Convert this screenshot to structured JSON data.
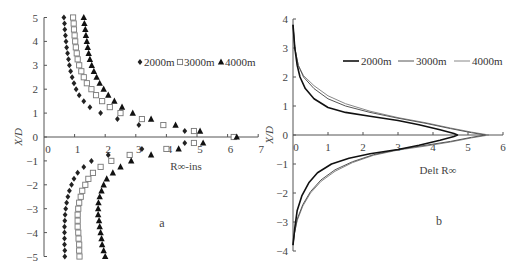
{
  "chart_data": [
    {
      "panel": "a",
      "type": "scatter",
      "title": "",
      "panel_label": "a",
      "xlabel": "R∞-ins",
      "ylabel": "X/D",
      "xlim": [
        0,
        7
      ],
      "ylim": [
        -5,
        5
      ],
      "xticks": [
        "0",
        "1",
        "2",
        "3",
        "4",
        "5",
        "6",
        "7"
      ],
      "yticks": [
        "5",
        "4",
        "3",
        "2",
        "1",
        "0",
        "−1",
        "−2",
        "−3",
        "−4",
        "−5"
      ],
      "grid": false,
      "legend_position": "upper right",
      "series": [
        {
          "name": "2000m",
          "marker": "diamond",
          "points": [
            [
              0.65,
              5
            ],
            [
              0.67,
              4.75
            ],
            [
              0.68,
              4.5
            ],
            [
              0.7,
              4.25
            ],
            [
              0.72,
              4
            ],
            [
              0.74,
              3.75
            ],
            [
              0.77,
              3.5
            ],
            [
              0.8,
              3.25
            ],
            [
              0.83,
              3
            ],
            [
              0.87,
              2.75
            ],
            [
              0.92,
              2.5
            ],
            [
              0.98,
              2.25
            ],
            [
              1.05,
              2
            ],
            [
              1.15,
              1.75
            ],
            [
              1.3,
              1.5
            ],
            [
              1.5,
              1.25
            ],
            [
              1.85,
              1
            ],
            [
              2.4,
              0.75
            ],
            [
              3.1,
              0.5
            ],
            [
              4.6,
              0.25
            ],
            [
              6.2,
              0
            ],
            [
              4.6,
              -0.25
            ],
            [
              3.2,
              -0.5
            ],
            [
              2.1,
              -0.75
            ],
            [
              1.55,
              -1
            ],
            [
              1.3,
              -1.25
            ],
            [
              1.1,
              -1.5
            ],
            [
              0.98,
              -1.75
            ],
            [
              0.9,
              -2
            ],
            [
              0.83,
              -2.25
            ],
            [
              0.78,
              -2.5
            ],
            [
              0.74,
              -2.75
            ],
            [
              0.71,
              -3
            ],
            [
              0.69,
              -3.25
            ],
            [
              0.68,
              -3.5
            ],
            [
              0.67,
              -3.75
            ],
            [
              0.67,
              -4
            ],
            [
              0.67,
              -4.25
            ],
            [
              0.67,
              -4.5
            ],
            [
              0.68,
              -4.75
            ],
            [
              0.68,
              -5
            ]
          ]
        },
        {
          "name": "3000m",
          "marker": "open-square",
          "points": [
            [
              0.95,
              5
            ],
            [
              0.97,
              4.75
            ],
            [
              0.98,
              4.5
            ],
            [
              1.0,
              4.25
            ],
            [
              1.02,
              4
            ],
            [
              1.04,
              3.75
            ],
            [
              1.07,
              3.5
            ],
            [
              1.1,
              3.25
            ],
            [
              1.15,
              3
            ],
            [
              1.22,
              2.75
            ],
            [
              1.3,
              2.5
            ],
            [
              1.4,
              2.25
            ],
            [
              1.55,
              2
            ],
            [
              1.7,
              1.75
            ],
            [
              1.9,
              1.5
            ],
            [
              2.15,
              1.25
            ],
            [
              2.5,
              1
            ],
            [
              3.2,
              0.75
            ],
            [
              3.9,
              0.5
            ],
            [
              4.9,
              0.25
            ],
            [
              6.2,
              0
            ],
            [
              4.9,
              -0.25
            ],
            [
              4.0,
              -0.5
            ],
            [
              2.8,
              -0.75
            ],
            [
              2.2,
              -1
            ],
            [
              1.85,
              -1.25
            ],
            [
              1.6,
              -1.5
            ],
            [
              1.45,
              -1.75
            ],
            [
              1.35,
              -2
            ],
            [
              1.25,
              -2.25
            ],
            [
              1.2,
              -2.5
            ],
            [
              1.15,
              -2.75
            ],
            [
              1.12,
              -3
            ],
            [
              1.1,
              -3.25
            ],
            [
              1.1,
              -3.5
            ],
            [
              1.1,
              -3.75
            ],
            [
              1.12,
              -4
            ],
            [
              1.13,
              -4.25
            ],
            [
              1.15,
              -4.5
            ],
            [
              1.15,
              -4.75
            ],
            [
              1.16,
              -5
            ]
          ]
        },
        {
          "name": "4000m",
          "marker": "filled-triangle",
          "points": [
            [
              1.3,
              5
            ],
            [
              1.32,
              4.75
            ],
            [
              1.35,
              4.5
            ],
            [
              1.37,
              4.25
            ],
            [
              1.4,
              4
            ],
            [
              1.43,
              3.75
            ],
            [
              1.46,
              3.5
            ],
            [
              1.5,
              3.25
            ],
            [
              1.56,
              3
            ],
            [
              1.63,
              2.75
            ],
            [
              1.72,
              2.5
            ],
            [
              1.82,
              2.25
            ],
            [
              1.95,
              2
            ],
            [
              2.1,
              1.75
            ],
            [
              2.3,
              1.5
            ],
            [
              2.55,
              1.25
            ],
            [
              2.9,
              1
            ],
            [
              3.5,
              0.75
            ],
            [
              4.3,
              0.5
            ],
            [
              5.1,
              0.25
            ],
            [
              6.3,
              0
            ],
            [
              5.2,
              -0.25
            ],
            [
              4.4,
              -0.5
            ],
            [
              3.5,
              -0.75
            ],
            [
              2.85,
              -1
            ],
            [
              2.5,
              -1.25
            ],
            [
              2.25,
              -1.5
            ],
            [
              2.05,
              -1.75
            ],
            [
              1.95,
              -2
            ],
            [
              1.88,
              -2.25
            ],
            [
              1.82,
              -2.5
            ],
            [
              1.78,
              -2.75
            ],
            [
              1.77,
              -3
            ],
            [
              1.77,
              -3.25
            ],
            [
              1.8,
              -3.5
            ],
            [
              1.82,
              -3.75
            ],
            [
              1.85,
              -4
            ],
            [
              1.88,
              -4.25
            ],
            [
              1.9,
              -4.5
            ],
            [
              1.95,
              -4.75
            ],
            [
              2.0,
              -5
            ]
          ]
        }
      ]
    },
    {
      "panel": "b",
      "type": "line",
      "title": "",
      "panel_label": "b",
      "xlabel": "Delt R∞",
      "ylabel": "X/D",
      "xlim": [
        0,
        6
      ],
      "ylim": [
        -4,
        4
      ],
      "xticks": [
        "0",
        "1",
        "2",
        "3",
        "4",
        "5",
        "6"
      ],
      "yticks": [
        "4",
        "3",
        "2",
        "1",
        "0",
        "−1",
        "−2",
        "−3",
        "−4"
      ],
      "grid": false,
      "legend_position": "upper right",
      "series": [
        {
          "name": "2000m",
          "color": "#111111",
          "width": 1.6,
          "points": [
            [
              0,
              3.8
            ],
            [
              0.05,
              3.0
            ],
            [
              0.12,
              2.4
            ],
            [
              0.2,
              2.0
            ],
            [
              0.35,
              1.6
            ],
            [
              0.6,
              1.25
            ],
            [
              1.0,
              0.95
            ],
            [
              1.5,
              0.78
            ],
            [
              2.2,
              0.65
            ],
            [
              3.0,
              0.5
            ],
            [
              3.6,
              0.35
            ],
            [
              4.2,
              0.18
            ],
            [
              4.6,
              0.05
            ],
            [
              4.7,
              0
            ],
            [
              4.6,
              -0.05
            ],
            [
              4.2,
              -0.18
            ],
            [
              3.6,
              -0.35
            ],
            [
              3.0,
              -0.5
            ],
            [
              2.2,
              -0.65
            ],
            [
              1.6,
              -0.8
            ],
            [
              1.1,
              -1.0
            ],
            [
              0.7,
              -1.3
            ],
            [
              0.45,
              -1.65
            ],
            [
              0.25,
              -2.1
            ],
            [
              0.12,
              -2.6
            ],
            [
              0.05,
              -3.2
            ],
            [
              0,
              -3.8
            ]
          ]
        },
        {
          "name": "3000m",
          "color": "#555555",
          "width": 1,
          "points": [
            [
              0,
              3.8
            ],
            [
              0.05,
              3.0
            ],
            [
              0.15,
              2.4
            ],
            [
              0.3,
              2.0
            ],
            [
              0.6,
              1.6
            ],
            [
              1.0,
              1.25
            ],
            [
              1.5,
              1.0
            ],
            [
              2.2,
              0.78
            ],
            [
              3.0,
              0.58
            ],
            [
              3.8,
              0.4
            ],
            [
              4.5,
              0.22
            ],
            [
              5.1,
              0.08
            ],
            [
              5.5,
              0
            ],
            [
              5.1,
              -0.08
            ],
            [
              4.5,
              -0.22
            ],
            [
              3.8,
              -0.35
            ],
            [
              3.0,
              -0.5
            ],
            [
              2.3,
              -0.68
            ],
            [
              1.7,
              -0.92
            ],
            [
              1.2,
              -1.2
            ],
            [
              0.8,
              -1.55
            ],
            [
              0.5,
              -1.95
            ],
            [
              0.28,
              -2.4
            ],
            [
              0.12,
              -2.9
            ],
            [
              0.04,
              -3.4
            ],
            [
              0,
              -3.8
            ]
          ]
        },
        {
          "name": "4000m",
          "color": "#888888",
          "width": 1,
          "points": [
            [
              0,
              3.8
            ],
            [
              0.05,
              3.0
            ],
            [
              0.15,
              2.4
            ],
            [
              0.3,
              2.05
            ],
            [
              0.6,
              1.7
            ],
            [
              1.0,
              1.35
            ],
            [
              1.5,
              1.08
            ],
            [
              2.2,
              0.82
            ],
            [
              3.0,
              0.6
            ],
            [
              3.8,
              0.42
            ],
            [
              4.5,
              0.24
            ],
            [
              5.1,
              0.1
            ],
            [
              5.6,
              0
            ],
            [
              5.1,
              -0.1
            ],
            [
              4.5,
              -0.24
            ],
            [
              3.8,
              -0.38
            ],
            [
              3.0,
              -0.52
            ],
            [
              2.3,
              -0.7
            ],
            [
              1.7,
              -0.95
            ],
            [
              1.2,
              -1.25
            ],
            [
              0.8,
              -1.6
            ],
            [
              0.5,
              -2.0
            ],
            [
              0.28,
              -2.45
            ],
            [
              0.12,
              -2.95
            ],
            [
              0.04,
              -3.4
            ],
            [
              0,
              -3.8
            ]
          ]
        }
      ]
    }
  ],
  "labels": {
    "a": {
      "ylabel": "X/D",
      "xlabel": "R∞-ins",
      "panel": "a",
      "legend": [
        "2000m",
        "3000m",
        "4000m"
      ]
    },
    "b": {
      "ylabel": "X/D",
      "xlabel": "Delt R∞",
      "panel": "b",
      "legend": [
        "2000m",
        "3000m",
        "4000m"
      ]
    }
  }
}
